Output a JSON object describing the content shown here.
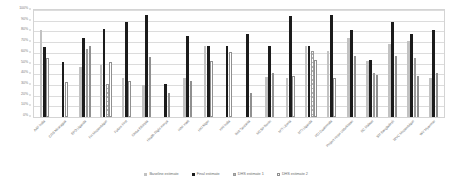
{
  "chart_data": {
    "type": "bar",
    "title": "",
    "xlabel": "",
    "ylabel": "",
    "ylim": [
      0,
      100
    ],
    "ytick_labels": [
      "100%",
      "90%",
      "80%",
      "70%",
      "60%",
      "50%",
      "40%",
      "30%",
      "20%",
      "10%",
      "0%"
    ],
    "ytick_values": [
      100,
      90,
      80,
      70,
      60,
      50,
      40,
      30,
      20,
      10,
      0
    ],
    "grid": true,
    "legend_position": "bottom-center",
    "categories": [
      "AAF India",
      "CRS Nicaragua",
      "EPD Uganda",
      "FH Mozambique",
      "Future First",
      "Globa Ethiopia",
      "Health Right Kenya",
      "HAF Haiti",
      "HKI Niger",
      "HKI India",
      "IMA Tanzania",
      "MCSP Benin",
      "MTI Liberia",
      "MTI Uganda",
      "PCI Guatemala",
      "Project Hope Uzbekistan",
      "SC Malawi",
      "SM Bangladesh",
      "WVC Mozambique",
      "WV Myanmar"
    ],
    "series": [
      {
        "name": "Baseline estimate",
        "color": "#c2c2c2",
        "values": [
          81,
          0,
          29,
          64,
          49,
          0,
          31,
          0,
          36,
          0,
          0,
          0,
          36,
          66,
          0,
          74,
          0,
          71,
          0,
          0
        ]
      },
      {
        "name": "Final estimate",
        "color": "#1c1c1c",
        "values": [
          65,
          51,
          0,
          74,
          82,
          89,
          95,
          0,
          76,
          0,
          66,
          78,
          94,
          66,
          57,
          95,
          89,
          78,
          68,
          81
        ]
      },
      {
        "name": "DHS estimate 1",
        "color": "#b5b5b5",
        "values": [
          0,
          0,
          0,
          64,
          0,
          0,
          0,
          0,
          0,
          0,
          0,
          0,
          0,
          62,
          0,
          0,
          0,
          0,
          0,
          0
        ]
      },
      {
        "name": "DHS estimate 2",
        "color": "#ffffff",
        "values": [
          55,
          33,
          31,
          66,
          51,
          0,
          34,
          22,
          0,
          0,
          34,
          0,
          60,
          53,
          0,
          41,
          0,
          0,
          38,
          0
        ]
      }
    ],
    "legend": [
      "Baseline estimate",
      "Final estimate",
      "DHS estimate 1",
      "DHS estimate 2"
    ],
    "groups": [
      {
        "label": "AAF India",
        "bars": [
          {
            "s": 0,
            "v": 81
          },
          {
            "s": 1,
            "v": 65
          },
          {
            "s": 3,
            "v": 55
          }
        ]
      },
      {
        "label": "CRS Nicaragua",
        "bars": [
          {
            "s": 1,
            "v": 51
          },
          {
            "s": 3,
            "v": 33
          }
        ]
      },
      {
        "label": "EPD Uganda",
        "bars": [
          {
            "s": 0,
            "v": 47
          },
          {
            "s": 1,
            "v": 74
          },
          {
            "s": 2,
            "v": 64
          },
          {
            "s": 3,
            "v": 66
          }
        ]
      },
      {
        "label": "FH Mozambique",
        "bars": [
          {
            "s": 0,
            "v": 49
          },
          {
            "s": 1,
            "v": 82
          },
          {
            "s": 2,
            "v": 31
          },
          {
            "s": 3,
            "v": 51
          }
        ]
      },
      {
        "label": "Future First",
        "bars": [
          {
            "s": 0,
            "v": 36
          },
          {
            "s": 1,
            "v": 89
          },
          {
            "s": 3,
            "v": 34
          }
        ]
      },
      {
        "label": "Globa Ethiopia",
        "bars": [
          {
            "s": 0,
            "v": 30
          },
          {
            "s": 1,
            "v": 95
          },
          {
            "s": 3,
            "v": 56
          }
        ]
      },
      {
        "label": "Health Right Kenya",
        "bars": [
          {
            "s": 1,
            "v": 31
          },
          {
            "s": 3,
            "v": 22
          }
        ]
      },
      {
        "label": "HAF Haiti",
        "bars": [
          {
            "s": 0,
            "v": 36
          },
          {
            "s": 1,
            "v": 76
          },
          {
            "s": 3,
            "v": 34
          }
        ]
      },
      {
        "label": "HKI Niger",
        "bars": [
          {
            "s": 0,
            "v": 66
          },
          {
            "s": 1,
            "v": 66
          },
          {
            "s": 3,
            "v": 52
          }
        ]
      },
      {
        "label": "HKI India",
        "bars": [
          {
            "s": 1,
            "v": 66
          },
          {
            "s": 3,
            "v": 61
          }
        ]
      },
      {
        "label": "IMA Tanzania",
        "bars": [
          {
            "s": 1,
            "v": 78
          },
          {
            "s": 3,
            "v": 22
          }
        ]
      },
      {
        "label": "MCSP Benin",
        "bars": [
          {
            "s": 0,
            "v": 37
          },
          {
            "s": 1,
            "v": 66
          },
          {
            "s": 3,
            "v": 41
          }
        ]
      },
      {
        "label": "MTI Liberia",
        "bars": [
          {
            "s": 0,
            "v": 36
          },
          {
            "s": 1,
            "v": 94
          },
          {
            "s": 3,
            "v": 38
          }
        ]
      },
      {
        "label": "MTI Uganda",
        "bars": [
          {
            "s": 0,
            "v": 66
          },
          {
            "s": 1,
            "v": 66
          },
          {
            "s": 2,
            "v": 62
          },
          {
            "s": 3,
            "v": 53
          }
        ]
      },
      {
        "label": "PCI Guatemala",
        "bars": [
          {
            "s": 0,
            "v": 62
          },
          {
            "s": 1,
            "v": 95
          },
          {
            "s": 3,
            "v": 36
          }
        ]
      },
      {
        "label": "Project Hope Uzbekistan",
        "bars": [
          {
            "s": 0,
            "v": 74
          },
          {
            "s": 1,
            "v": 81
          },
          {
            "s": 3,
            "v": 57
          }
        ]
      },
      {
        "label": "SC Malawi",
        "bars": [
          {
            "s": 0,
            "v": 52
          },
          {
            "s": 1,
            "v": 53
          },
          {
            "s": 2,
            "v": 41
          },
          {
            "s": 3,
            "v": 39
          }
        ]
      },
      {
        "label": "SM Bangladesh",
        "bars": [
          {
            "s": 0,
            "v": 68
          },
          {
            "s": 1,
            "v": 89
          },
          {
            "s": 3,
            "v": 57
          }
        ]
      },
      {
        "label": "WVC Mozambique",
        "bars": [
          {
            "s": 0,
            "v": 71
          },
          {
            "s": 1,
            "v": 78
          },
          {
            "s": 2,
            "v": 55
          },
          {
            "s": 3,
            "v": 38
          }
        ]
      },
      {
        "label": "WV Myanmar",
        "bars": [
          {
            "s": 0,
            "v": 36
          },
          {
            "s": 1,
            "v": 81
          },
          {
            "s": 3,
            "v": 41
          }
        ]
      }
    ]
  }
}
